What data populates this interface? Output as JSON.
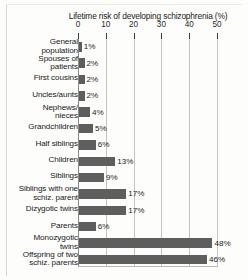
{
  "chart_data": {
    "type": "bar",
    "orientation": "horizontal",
    "title": "Lifetime risk of  developing schizophrenia (%)",
    "xlabel": "",
    "ylabel": "",
    "xlim": [
      0,
      50
    ],
    "xticks": [
      "0",
      "10",
      "20",
      "30",
      "40",
      "50"
    ],
    "xtick_values": [
      0,
      10,
      20,
      30,
      40,
      50
    ],
    "grid": true,
    "legend": false,
    "bar_color": "#5e5e5e",
    "categories": [
      "General population",
      "Spouses of patients",
      "First cousins",
      "Uncles/aunts",
      "Nephews/ nieces",
      "Grandchildren",
      "Half siblings",
      "Children",
      "Siblings",
      "Siblings with one schiz. parent",
      "Dizygotic twins",
      "Parents",
      "Monozygotic twins",
      "Offspring of two schiz. parents"
    ],
    "values": [
      1,
      2,
      2,
      2,
      4,
      5,
      6,
      13,
      9,
      17,
      17,
      6,
      48,
      46
    ],
    "value_labels": [
      "1%",
      "2%",
      "2%",
      "2%",
      "4%",
      "5%",
      "6%",
      "13%",
      "9%",
      "17%",
      "17%",
      "6%",
      "48%",
      "46%"
    ],
    "rows": [
      {
        "label_line1": "General",
        "label_line2": "population",
        "value": 1,
        "value_label": "1%"
      },
      {
        "label_line1": "Spouses of",
        "label_line2": "patients",
        "value": 2,
        "value_label": "2%"
      },
      {
        "label_line1": "First cousins",
        "label_line2": "",
        "value": 2,
        "value_label": "2%"
      },
      {
        "label_line1": "Uncles/aunts",
        "label_line2": "",
        "value": 2,
        "value_label": "2%"
      },
      {
        "label_line1": "Nephews/",
        "label_line2": "nieces",
        "value": 4,
        "value_label": "4%"
      },
      {
        "label_line1": "Grandchildren",
        "label_line2": "",
        "value": 5,
        "value_label": "5%"
      },
      {
        "label_line1": "Half siblings",
        "label_line2": "",
        "value": 6,
        "value_label": "6%"
      },
      {
        "label_line1": "Children",
        "label_line2": "",
        "value": 13,
        "value_label": "13%"
      },
      {
        "label_line1": "Siblings",
        "label_line2": "",
        "value": 9,
        "value_label": "9%"
      },
      {
        "label_line1": "Siblings with one",
        "label_line2": "schiz. parent",
        "value": 17,
        "value_label": "17%"
      },
      {
        "label_line1": "Dizygotic twins",
        "label_line2": "",
        "value": 17,
        "value_label": "17%"
      },
      {
        "label_line1": "Parents",
        "label_line2": "",
        "value": 6,
        "value_label": "6%"
      },
      {
        "label_line1": "Monozygotic",
        "label_line2": "twins",
        "value": 48,
        "value_label": "48%"
      },
      {
        "label_line1": "Offspring of two",
        "label_line2": "schiz. parents",
        "value": 46,
        "value_label": "46%"
      }
    ]
  }
}
